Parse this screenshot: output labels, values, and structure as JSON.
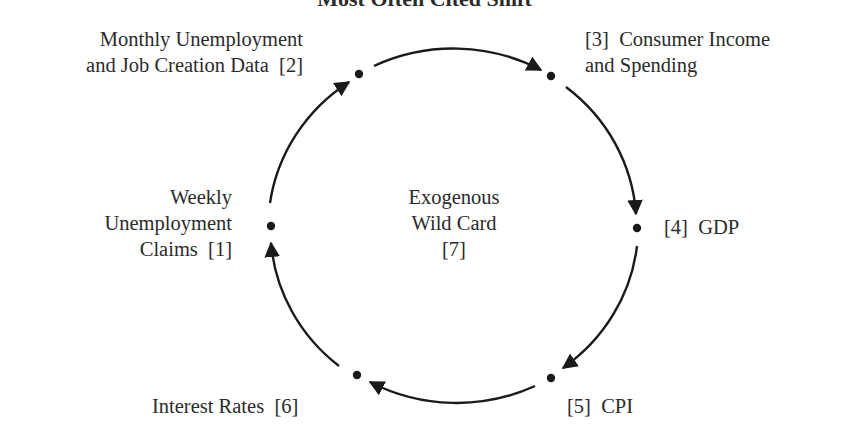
{
  "title": "Most Often Cited Shift",
  "center": {
    "lines": [
      "Exogenous",
      "Wild Card",
      "[7]"
    ]
  },
  "nodes": [
    {
      "id": 1,
      "lines": [
        "Weekly",
        "Unemployment",
        "Claims  [1]"
      ]
    },
    {
      "id": 2,
      "lines": [
        "Monthly Unemployment",
        "and Job Creation Data  [2]"
      ]
    },
    {
      "id": 3,
      "lines": [
        "[3]  Consumer Income",
        "and Spending"
      ]
    },
    {
      "id": 4,
      "lines": [
        "[4]  GDP"
      ]
    },
    {
      "id": 5,
      "lines": [
        "[5]  CPI"
      ]
    },
    {
      "id": 6,
      "lines": [
        "Interest Rates  [6]"
      ]
    }
  ],
  "cycle_order": [
    1,
    2,
    3,
    4,
    5,
    6
  ],
  "colors": {
    "stroke": "#1a1a1a",
    "text": "#2b2b2b"
  }
}
